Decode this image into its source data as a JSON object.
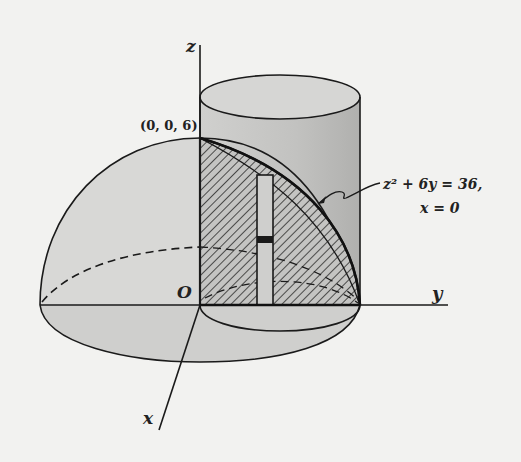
{
  "figure": {
    "type": "3D solid region diagram",
    "axes": {
      "x_label": "x",
      "y_label": "y",
      "z_label": "z",
      "origin_label": "O"
    },
    "point_labels": [
      {
        "text": "(0, 0, 6)"
      }
    ],
    "annotation": {
      "equation_line1": "z² + 6y  =  36,",
      "equation_line2": "x = 0"
    },
    "surfaces": [
      "hemisphere",
      "cylinder",
      "parabolic cross-section (hatched)",
      "vertical strip element"
    ],
    "colors": {
      "background": "#f2f2f0",
      "surface_fill": "#d6d6d4",
      "cylinder_fill": "#c8c8c6",
      "line": "#1a1a1a",
      "hatch": "#333333"
    }
  }
}
